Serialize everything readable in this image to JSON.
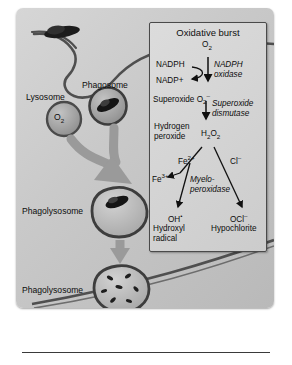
{
  "figure": {
    "panel_title": "Oxidative burst",
    "cell_labels": [
      {
        "id": "lysosome",
        "text": "Lysosome"
      },
      {
        "id": "phagosome",
        "text": "Phagosome"
      },
      {
        "id": "oxygen-vesicle",
        "text": "O2"
      },
      {
        "id": "phagolysosome-1",
        "text": "Phagolysosome"
      },
      {
        "id": "phagolysosome-2",
        "text": "Phagolysosome"
      }
    ],
    "pathway": {
      "oxygen": "O2",
      "nadph": "NADPH",
      "nadp_plus": "NADP+",
      "nadph_oxidase": "NADPH oxidase",
      "superoxide_name": "Superoxide",
      "superoxide_formula": "O2–",
      "superoxide_dismutase": "Superoxide dismutase",
      "hydrogen_peroxide_name": "Hydrogen peroxide",
      "hydrogen_peroxide_formula": "H2O2",
      "fe2": "Fe2+",
      "fe3": "Fe3+",
      "chloride": "Cl–",
      "myeloperoxidase": "Myelo- peroxidase",
      "hydroxyl_formula": "OH•",
      "hydroxyl_name": "Hydroxyl radical",
      "hypochlorite_formula": "OCl–",
      "hypochlorite_name": "Hypochlorite"
    },
    "colors": {
      "background": "#c9c9c9",
      "panel": "#d5d5d5",
      "outline": "#3a3a3a",
      "arrow_gray": "#9a9a9a",
      "text": "#0d0d0d"
    }
  }
}
